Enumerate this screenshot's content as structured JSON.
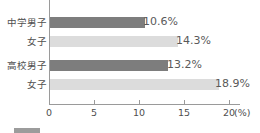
{
  "chart_data": {
    "type": "bar",
    "orientation": "horizontal",
    "title": "",
    "xlabel": "(%)",
    "ylabel": "",
    "xlim": [
      0,
      20
    ],
    "xticks": [
      0,
      5,
      10,
      15,
      20
    ],
    "xtick_labels": [
      "0",
      "5",
      "10",
      "15",
      "20"
    ],
    "unit_label": "(%)",
    "grid": false,
    "legend_position": "bottom",
    "categories": [
      "中学男子",
      "女子",
      "高校男子",
      "女子"
    ],
    "values": [
      10.6,
      14.3,
      13.2,
      18.9
    ],
    "value_labels": [
      "10.6%",
      "14.3%",
      "13.2%",
      "18.9%"
    ],
    "bars": [
      {
        "category": "中学男子",
        "value": 10.6,
        "label": "10.6%",
        "style": "dark",
        "color": "#7d7d7d"
      },
      {
        "category": "女子",
        "value": 14.3,
        "label": "14.3%",
        "style": "light",
        "color": "#dcdcdc"
      },
      {
        "category": "高校男子",
        "value": 13.2,
        "label": "13.2%",
        "style": "dark",
        "color": "#7d7d7d"
      },
      {
        "category": "女子",
        "value": 18.9,
        "label": "18.9%",
        "style": "light",
        "color": "#dcdcdc"
      }
    ],
    "colors": {
      "dark_bar": "#7d7d7d",
      "light_bar": "#dcdcdc",
      "axis": "#9a9a9a",
      "text": "#4f4f4f"
    }
  },
  "legend": {
    "swatch_color": "#9c9c9c",
    "text": ""
  }
}
